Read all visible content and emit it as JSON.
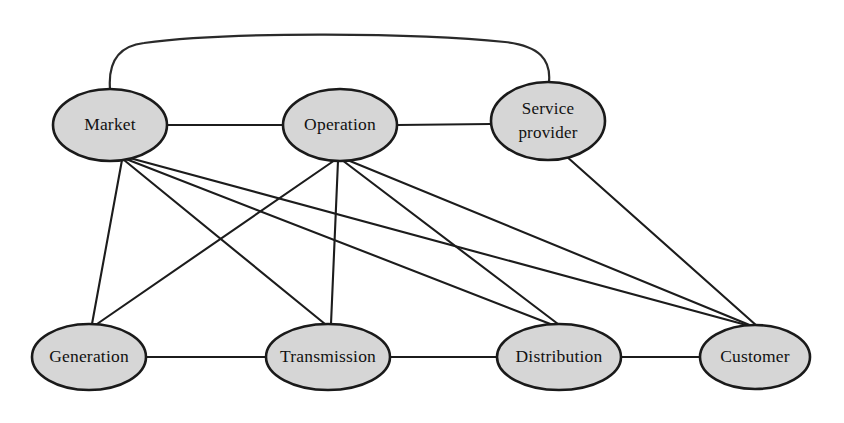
{
  "diagram": {
    "type": "node-link-graph",
    "canvas": {
      "width": 844,
      "height": 423
    },
    "style": {
      "node_fill": "#d6d6d6",
      "node_stroke": "#1a1a1a",
      "edge_stroke": "#1c1c1c",
      "background": "#ffffff"
    },
    "nodes": [
      {
        "id": "market",
        "label": "Market",
        "cx": 110,
        "cy": 125,
        "rx": 57,
        "ry": 36,
        "lines": [
          "Market"
        ]
      },
      {
        "id": "operation",
        "label": "Operation",
        "cx": 340,
        "cy": 125,
        "rx": 57,
        "ry": 36,
        "lines": [
          "Operation"
        ]
      },
      {
        "id": "service-provider",
        "label": "Service provider",
        "cx": 548,
        "cy": 121,
        "rx": 57,
        "ry": 39,
        "lines": [
          "Service",
          "provider"
        ]
      },
      {
        "id": "generation",
        "label": "Generation",
        "cx": 89,
        "cy": 357,
        "rx": 57,
        "ry": 33,
        "lines": [
          "Generation"
        ]
      },
      {
        "id": "transmission",
        "label": "Transmission",
        "cx": 328,
        "cy": 357,
        "rx": 62,
        "ry": 33,
        "lines": [
          "Transmission"
        ]
      },
      {
        "id": "distribution",
        "label": "Distribution",
        "cx": 559,
        "cy": 357,
        "rx": 62,
        "ry": 33,
        "lines": [
          "Distribution"
        ]
      },
      {
        "id": "customer",
        "label": "Customer",
        "cx": 755,
        "cy": 357,
        "rx": 55,
        "ry": 32,
        "lines": [
          "Customer"
        ]
      }
    ],
    "edges": [
      {
        "id": "market-operation",
        "from": "market",
        "to": "operation",
        "kind": "straight"
      },
      {
        "id": "operation-service-provider",
        "from": "operation",
        "to": "service-provider",
        "kind": "straight"
      },
      {
        "id": "market-service-provider",
        "from": "market",
        "to": "service-provider",
        "kind": "curved-arc-top"
      },
      {
        "id": "generation-transmission",
        "from": "generation",
        "to": "transmission",
        "kind": "straight"
      },
      {
        "id": "transmission-distribution",
        "from": "transmission",
        "to": "distribution",
        "kind": "straight"
      },
      {
        "id": "distribution-customer",
        "from": "distribution",
        "to": "customer",
        "kind": "straight"
      },
      {
        "id": "market-generation",
        "from": "market",
        "to": "generation",
        "kind": "straight"
      },
      {
        "id": "market-transmission",
        "from": "market",
        "to": "transmission",
        "kind": "straight"
      },
      {
        "id": "market-distribution",
        "from": "market",
        "to": "distribution",
        "kind": "straight"
      },
      {
        "id": "market-customer",
        "from": "market",
        "to": "customer",
        "kind": "straight"
      },
      {
        "id": "operation-generation",
        "from": "operation",
        "to": "generation",
        "kind": "straight"
      },
      {
        "id": "operation-transmission",
        "from": "operation",
        "to": "transmission",
        "kind": "straight"
      },
      {
        "id": "operation-distribution",
        "from": "operation",
        "to": "distribution",
        "kind": "straight"
      },
      {
        "id": "operation-customer",
        "from": "operation",
        "to": "customer",
        "kind": "straight"
      },
      {
        "id": "service-provider-customer",
        "from": "service-provider",
        "to": "customer",
        "kind": "straight"
      }
    ]
  }
}
